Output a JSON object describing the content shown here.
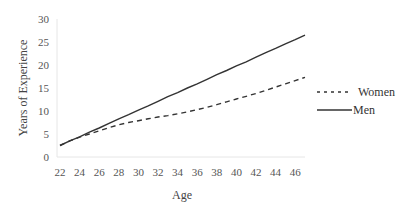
{
  "chart_data": {
    "type": "line",
    "title": "",
    "xlabel": "Age",
    "ylabel": "Years of Experience",
    "xlim": [
      22,
      47
    ],
    "ylim": [
      0,
      30
    ],
    "x_ticks": [
      "22",
      "24",
      "26",
      "28",
      "30",
      "32",
      "34",
      "36",
      "38",
      "40",
      "42",
      "44",
      "46"
    ],
    "y_ticks": [
      "0",
      "5",
      "10",
      "15",
      "20",
      "25",
      "30"
    ],
    "grid": false,
    "legend_position": "right",
    "x": [
      22,
      23,
      24,
      25,
      26,
      27,
      28,
      29,
      30,
      31,
      32,
      33,
      34,
      35,
      36,
      37,
      38,
      39,
      40,
      41,
      42,
      43,
      44,
      45,
      46,
      47
    ],
    "series": [
      {
        "name": "Women",
        "style": "dashed",
        "color": "#333333",
        "values": [
          2.5,
          3.5,
          4.3,
          5.0,
          5.7,
          6.4,
          7.0,
          7.5,
          7.9,
          8.3,
          8.7,
          9.0,
          9.4,
          9.8,
          10.3,
          10.8,
          11.4,
          12.0,
          12.6,
          13.2,
          13.8,
          14.5,
          15.2,
          15.9,
          16.6,
          17.3
        ]
      },
      {
        "name": "Men",
        "style": "solid",
        "color": "#333333",
        "values": [
          2.5,
          3.5,
          4.4,
          5.4,
          6.3,
          7.3,
          8.3,
          9.2,
          10.2,
          11.1,
          12.1,
          13.1,
          14.0,
          15.0,
          15.9,
          16.9,
          17.9,
          18.8,
          19.8,
          20.7,
          21.7,
          22.7,
          23.6,
          24.6,
          25.5,
          26.5
        ]
      }
    ]
  }
}
